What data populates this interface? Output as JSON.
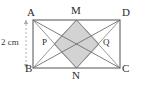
{
  "figure": {
    "kind": "geometry-diagram",
    "background_color": "#ffffff",
    "stroke_color": "#6e6e6e",
    "label_color": "#2b2b2b",
    "shaded_fill": "#d3d3d3",
    "shaded_stroke": "#8c8c8c",
    "dash_color": "#a9a9a9"
  },
  "vertex_labels": [
    {
      "id": "A",
      "text": "A",
      "x": 27,
      "y": 13,
      "role": "rectangle-corner-top-left"
    },
    {
      "id": "M",
      "text": "M",
      "x": 71,
      "y": 10,
      "role": "midpoint-top-side"
    },
    {
      "id": "D",
      "text": "D",
      "x": 122,
      "y": 13,
      "role": "rectangle-corner-top-right"
    },
    {
      "id": "P",
      "text": "P",
      "x": 41,
      "y": 39,
      "role": "intersection-left"
    },
    {
      "id": "Q",
      "text": "Q",
      "x": 104,
      "y": 39,
      "role": "intersection-right"
    },
    {
      "id": "B",
      "text": "B",
      "x": 25,
      "y": 66,
      "role": "rectangle-corner-bottom-left"
    },
    {
      "id": "N",
      "text": "N",
      "x": 72,
      "y": 71,
      "role": "midpoint-bottom-side"
    },
    {
      "id": "C",
      "text": "C",
      "x": 122,
      "y": 66,
      "role": "rectangle-corner-bottom-right"
    }
  ],
  "dimension_labels": [
    {
      "id": "height",
      "text": "2 cm",
      "x": 2,
      "y": 39,
      "measures": "side AB"
    }
  ],
  "geometry": {
    "rectangle": {
      "A": {
        "x": 33,
        "y": 20
      },
      "D": {
        "x": 120,
        "y": 20
      },
      "C": {
        "x": 120,
        "y": 68
      },
      "B": {
        "x": 33,
        "y": 68
      }
    },
    "midpoints": {
      "M": {
        "x": 76.5,
        "y": 20
      },
      "N": {
        "x": 76.5,
        "y": 68
      }
    },
    "intersections": {
      "P": {
        "x": 54,
        "y": 44
      },
      "Q": {
        "x": 99,
        "y": 44
      }
    },
    "shaded_polygon": [
      "M",
      "Q",
      "N",
      "P"
    ],
    "segments": [
      {
        "from": "A",
        "to": "C",
        "kind": "diagonal"
      },
      {
        "from": "B",
        "to": "D",
        "kind": "diagonal"
      },
      {
        "from": "A",
        "to": "N",
        "kind": "cevian"
      },
      {
        "from": "N",
        "to": "D",
        "kind": "cevian"
      },
      {
        "from": "B",
        "to": "M",
        "kind": "cevian"
      },
      {
        "from": "M",
        "to": "C",
        "kind": "cevian"
      }
    ],
    "dimension_line": {
      "x": 26,
      "y1": 20,
      "y2": 68,
      "style": "dashed"
    }
  }
}
